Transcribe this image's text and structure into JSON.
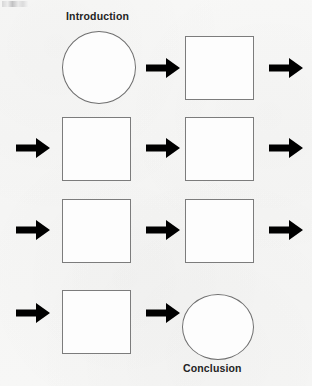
{
  "page": {
    "background_color": "#f7f7f6",
    "shape_fill": "#fdfdfd",
    "shape_border_color": "#7c7c7c",
    "arrow_color": "#000000",
    "label_color": "#232323"
  },
  "labels": {
    "introduction": "Introduction",
    "conclusion": "Conclusion"
  },
  "diagram": {
    "rows": [
      {
        "index": 1,
        "left_arrow": false,
        "shape_left": "circle",
        "shape_left_label": "Introduction",
        "middle_arrow": true,
        "shape_right": "square",
        "shape_right_label": "",
        "right_arrow": true
      },
      {
        "index": 2,
        "left_arrow": true,
        "shape_left": "square",
        "shape_left_label": "",
        "middle_arrow": true,
        "shape_right": "square",
        "shape_right_label": "",
        "right_arrow": true
      },
      {
        "index": 3,
        "left_arrow": true,
        "shape_left": "square",
        "shape_left_label": "",
        "middle_arrow": true,
        "shape_right": "square",
        "shape_right_label": "",
        "right_arrow": true
      },
      {
        "index": 4,
        "left_arrow": true,
        "shape_left": "square",
        "shape_left_label": "",
        "middle_arrow": true,
        "shape_right": "circle",
        "shape_right_label": "Conclusion",
        "right_arrow": false
      }
    ],
    "total_shapes": 8,
    "total_arrows": 10,
    "icons": {
      "arrow": "arrow-right-icon"
    }
  }
}
